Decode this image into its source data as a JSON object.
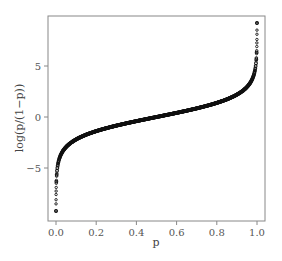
{
  "chart_data": {
    "type": "scatter",
    "title": "",
    "xlabel": "p",
    "ylabel": "log(p/(1−p))",
    "xlim": [
      -0.04,
      1.04
    ],
    "ylim": [
      -9.8,
      9.8
    ],
    "x_ticks": [
      0.0,
      0.2,
      0.4,
      0.6,
      0.8,
      1.0
    ],
    "x_tick_labels": [
      "0.0",
      "0.2",
      "0.4",
      "0.6",
      "0.8",
      "1.0"
    ],
    "y_ticks": [
      -5,
      0,
      5
    ],
    "y_tick_labels": [
      "−5",
      "0",
      "5"
    ],
    "grid": false,
    "legend": null,
    "function": "logit(p) = log(p/(1-p))",
    "p_range": [
      0.0001,
      0.9999
    ],
    "point_count": 10000,
    "marker": "open circle, small",
    "marker_color": "#111111",
    "sample_points": [
      {
        "x": 0.0001,
        "y": -9.21
      },
      {
        "x": 0.001,
        "y": -6.91
      },
      {
        "x": 0.01,
        "y": -4.6
      },
      {
        "x": 0.05,
        "y": -2.94
      },
      {
        "x": 0.1,
        "y": -2.2
      },
      {
        "x": 0.2,
        "y": -1.39
      },
      {
        "x": 0.3,
        "y": -0.85
      },
      {
        "x": 0.4,
        "y": -0.41
      },
      {
        "x": 0.5,
        "y": 0.0
      },
      {
        "x": 0.6,
        "y": 0.41
      },
      {
        "x": 0.7,
        "y": 0.85
      },
      {
        "x": 0.8,
        "y": 1.39
      },
      {
        "x": 0.9,
        "y": 2.2
      },
      {
        "x": 0.95,
        "y": 2.94
      },
      {
        "x": 0.99,
        "y": 4.6
      },
      {
        "x": 0.999,
        "y": 6.91
      },
      {
        "x": 0.9999,
        "y": 9.21
      }
    ]
  },
  "axes": {
    "x": {
      "label": "p",
      "ticks": [
        "0.0",
        "0.2",
        "0.4",
        "0.6",
        "0.8",
        "1.0"
      ]
    },
    "y": {
      "label": "log(p/(1−p))",
      "ticks": [
        "5",
        "0",
        "−5"
      ]
    }
  },
  "colors": {
    "frame": "#888888",
    "points": "#111111",
    "text": "#444444",
    "background": "#ffffff"
  }
}
